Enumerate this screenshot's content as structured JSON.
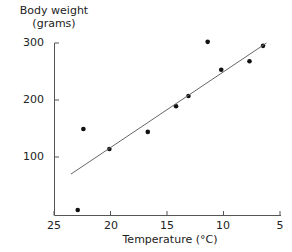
{
  "chart_data": {
    "type": "scatter",
    "title": "",
    "xlabel": "Temperature (°C)",
    "ylabel": "Body weight (grams)",
    "ylabel_lines": [
      "Body weight",
      "(grams)"
    ],
    "xlim": [
      25,
      5
    ],
    "ylim": [
      0,
      300
    ],
    "x_reversed": true,
    "grid": false,
    "legend": null,
    "x_ticks": [
      25,
      20,
      15,
      10,
      5
    ],
    "y_ticks": [
      100,
      200,
      300
    ],
    "series": [
      {
        "name": "observations",
        "type": "scatter",
        "points": [
          {
            "x": 22.9,
            "y": 7
          },
          {
            "x": 22.4,
            "y": 149
          },
          {
            "x": 20.1,
            "y": 114
          },
          {
            "x": 16.7,
            "y": 144
          },
          {
            "x": 14.2,
            "y": 189
          },
          {
            "x": 13.1,
            "y": 207
          },
          {
            "x": 11.4,
            "y": 302
          },
          {
            "x": 10.2,
            "y": 253
          },
          {
            "x": 7.7,
            "y": 268
          },
          {
            "x": 6.5,
            "y": 295
          }
        ]
      },
      {
        "name": "regression line",
        "type": "line",
        "points": [
          {
            "x": 23.5,
            "y": 70
          },
          {
            "x": 6.2,
            "y": 300
          }
        ]
      }
    ]
  }
}
